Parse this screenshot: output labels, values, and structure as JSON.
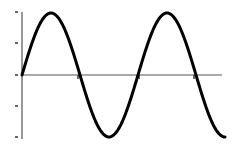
{
  "chart_data": {
    "type": "line",
    "title": "",
    "xlabel": "",
    "ylabel": "",
    "grid": false,
    "legend": null,
    "series": [
      {
        "name": "sine wave",
        "description": "approximately 1.75 periods of a sine wave starting at origin going upward",
        "x": [
          0,
          0.5,
          1,
          1.5,
          2,
          2.5,
          3,
          3.5
        ],
        "values": [
          0,
          1,
          0,
          -1,
          0,
          1,
          0,
          -0.95
        ]
      }
    ],
    "ylim": [
      -1,
      1
    ],
    "y_ticks": [
      -1,
      -0.5,
      0,
      0.5,
      1
    ],
    "x_ticks_on_axis": [
      1,
      2,
      3
    ],
    "tick_labels": []
  },
  "colors": {
    "line": "#000000",
    "axis": "#555555",
    "background": "#ffffff"
  }
}
